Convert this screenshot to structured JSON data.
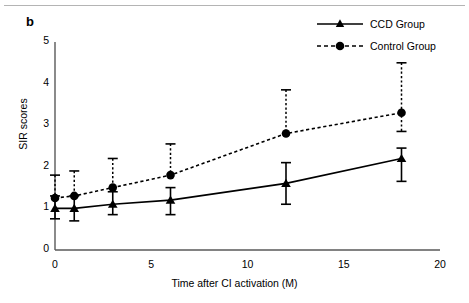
{
  "figure": {
    "panel_label": "b",
    "divider": "top-rule"
  },
  "chart_data": {
    "type": "line",
    "title": "",
    "xlabel": "Time after CI activation (M)",
    "ylabel": "SIR scores",
    "xlim": [
      0,
      20
    ],
    "ylim": [
      0,
      5
    ],
    "xticks": [
      "0",
      "5",
      "10",
      "15",
      "20"
    ],
    "xtick_values": [
      0,
      5,
      10,
      15,
      20
    ],
    "yticks": [
      "0",
      "1",
      "2",
      "3",
      "4",
      "5"
    ],
    "ytick_values": [
      0,
      1,
      2,
      3,
      4,
      5
    ],
    "grid": false,
    "legend_position": "top-right",
    "x": [
      0,
      1,
      3,
      6,
      12,
      18
    ],
    "series": [
      {
        "name": "CCD Group",
        "marker": "triangle",
        "linestyle": "solid",
        "color": "#000000",
        "values": [
          1.0,
          1.0,
          1.1,
          1.2,
          1.6,
          2.2
        ],
        "err_low": [
          0.75,
          0.7,
          0.85,
          0.85,
          1.1,
          1.65
        ],
        "err_high": [
          1.3,
          1.3,
          1.4,
          1.5,
          2.1,
          2.45
        ]
      },
      {
        "name": "Control Group",
        "marker": "circle",
        "linestyle": "dashed",
        "color": "#000000",
        "values": [
          1.25,
          1.3,
          1.5,
          1.8,
          2.8,
          3.3
        ],
        "err_low": [
          1.25,
          1.3,
          1.5,
          1.8,
          2.8,
          2.85
        ],
        "err_high": [
          1.8,
          1.9,
          2.2,
          2.55,
          3.85,
          4.5
        ]
      }
    ]
  },
  "legend": {
    "items": [
      {
        "label": "CCD Group",
        "marker": "triangle",
        "linestyle": "solid"
      },
      {
        "label": "Control Group",
        "marker": "circle",
        "linestyle": "dashed"
      }
    ]
  }
}
